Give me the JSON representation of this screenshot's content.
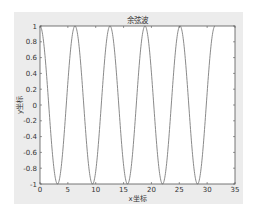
{
  "chart_data": {
    "type": "line",
    "title": "余弦波",
    "xlabel": "x坐标",
    "ylabel": "y坐标",
    "xlim": [
      0,
      35
    ],
    "ylim": [
      -1,
      1
    ],
    "xticks": [
      0,
      5,
      10,
      15,
      20,
      25,
      30,
      35
    ],
    "yticks": [
      -1,
      -0.8,
      -0.6,
      -0.4,
      -0.2,
      0,
      0.2,
      0.4,
      0.6,
      0.8,
      1
    ],
    "xtick_labels": [
      "0",
      "5",
      "10",
      "15",
      "20",
      "25",
      "30",
      "35"
    ],
    "ytick_labels": [
      "-1",
      "-0.8",
      "-0.6",
      "-0.4",
      "-0.2",
      "0",
      "0.2",
      "0.4",
      "0.6",
      "0.8",
      "1"
    ],
    "grid": false,
    "legend": null,
    "series": [
      {
        "name": "cos(x)",
        "function": "y = cos(x)",
        "x_range": [
          0,
          31.4159
        ],
        "color": "#8a8a8a",
        "key_points": [
          {
            "x": 0,
            "y": 1
          },
          {
            "x": 3.1416,
            "y": -1
          },
          {
            "x": 6.2832,
            "y": 1
          },
          {
            "x": 9.4248,
            "y": -1
          },
          {
            "x": 12.5664,
            "y": 1
          },
          {
            "x": 15.708,
            "y": -1
          },
          {
            "x": 18.8496,
            "y": 1
          },
          {
            "x": 21.9911,
            "y": -1
          },
          {
            "x": 25.1327,
            "y": 1
          },
          {
            "x": 28.2743,
            "y": -1
          },
          {
            "x": 31.4159,
            "y": 1
          }
        ]
      }
    ]
  },
  "colors": {
    "figure_background": "#ececec",
    "axes_background": "#ffffff",
    "axes_edge": "#555555",
    "line": "#8a8a8a"
  }
}
